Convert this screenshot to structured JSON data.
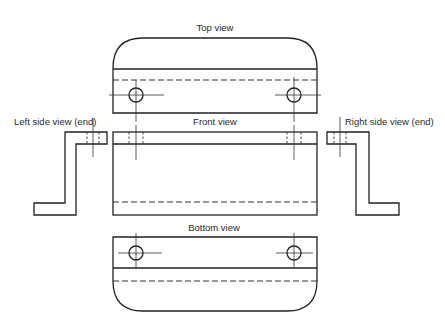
{
  "diagram": {
    "type": "orthographic-projection",
    "views": {
      "top": {
        "label": "Top view"
      },
      "front": {
        "label": "Front view"
      },
      "left": {
        "label": "Left side view (end)"
      },
      "right": {
        "label": "Right side view (end)"
      },
      "bottom": {
        "label": "Bottom view"
      }
    },
    "colors": {
      "line": "#222222",
      "background": "#ffffff"
    }
  }
}
